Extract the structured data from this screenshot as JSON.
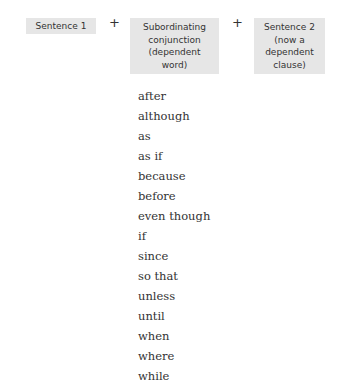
{
  "diagram": {
    "boxes": [
      {
        "label": "Sentence 1"
      },
      {
        "label": "Subordinating\nconjunction\n(dependent\nword)"
      },
      {
        "label": "Sentence 2\n(now a\ndependent\nclause)"
      }
    ],
    "operators": [
      "+",
      "+"
    ],
    "conjunctions": [
      "after",
      "although",
      "as",
      "as if",
      "because",
      "before",
      "even though",
      "if",
      "since",
      "so that",
      "unless",
      "until",
      "when",
      "where",
      "while"
    ]
  },
  "colors": {
    "box_fill": "#e6e6e6",
    "text": "#333333"
  }
}
